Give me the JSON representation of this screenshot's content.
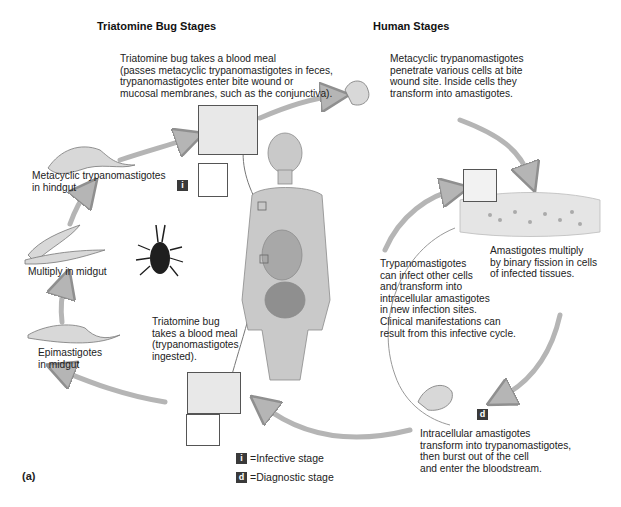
{
  "headings": {
    "bug_stages": "Triatomine Bug Stages",
    "human_stages": "Human Stages"
  },
  "steps": {
    "bug_blood_meal_infect": "Triatomine bug takes a blood meal\n(passes metacyclic trypanomastigotes in feces,\ntrypanomastigotes enter bite wound or\nmucosal membranes, such as the conjunctiva).",
    "penetrate_cells": "Metacyclic trypanomastigotes\npenetrate various cells at bite\nwound site. Inside cells they\ntransform into amastigotes.",
    "amastigotes_multiply": "Amastigotes multiply\nby binary fission in cells\nof infected tissues.",
    "infect_other_cells": "Trypanomastigotes\ncan infect other cells\nand transform into\nintracellular amastigotes\nin new infection sites.\nClinical manifestations can\nresult from this infective cycle.",
    "burst_out": "Intracellular amastigotes\ntransform into trypanomastigotes,\nthen burst out of the cell\nand enter the bloodstream.",
    "bug_blood_meal_ingest": "Triatomine bug\ntakes a blood meal\n(trypanomastigotes\ningested).",
    "epimastigotes": "Epimastigotes\nin midgut",
    "multiply_midgut": "Multiply in midgut",
    "metacyclic_hindgut": "Metacyclic trypanomastigotes\nin hindgut"
  },
  "badges": {
    "infective": "i",
    "diagnostic": "d"
  },
  "legend": {
    "infective_label": "=Infective stage",
    "diagnostic_label": "=Diagnostic stage"
  },
  "panel_label": "(a)",
  "colors": {
    "arrow_fill": "#b5b5b5",
    "arrow_stroke": "#8f8f8f",
    "badge_bg": "#3a3a3a",
    "circle_line": "#999999"
  }
}
